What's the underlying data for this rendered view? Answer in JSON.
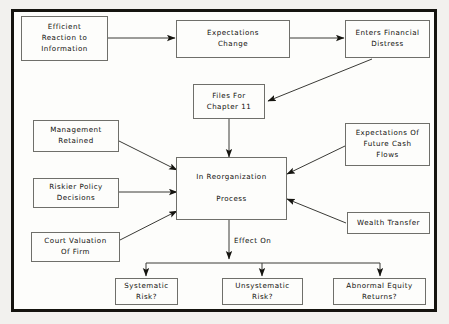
{
  "diagram": {
    "frame": {
      "border_color": "#15140f",
      "background": "#fdfdfb"
    },
    "page_background": "#f2f1ee",
    "line_color": "#3a3a36",
    "text_color": "#100f0b",
    "nodes": [
      {
        "id": "efficient-reaction",
        "label": "Efficient\nReaction to\nInformation"
      },
      {
        "id": "expectations-change",
        "label": "Expectations\nChange"
      },
      {
        "id": "enters-financial-distress",
        "label": "Enters Financial\nDistress"
      },
      {
        "id": "files-chapter-11",
        "label": "Files For\nChapter 11"
      },
      {
        "id": "management-retained",
        "label": "Management\nRetained"
      },
      {
        "id": "riskier-policy-decisions",
        "label": "Riskier Policy\nDecisions"
      },
      {
        "id": "court-valuation-of-firm",
        "label": "Court Valuation\nOf Firm"
      },
      {
        "id": "in-reorganization-process",
        "label": "In Reorganization\n\nProcess"
      },
      {
        "id": "expectations-future-cash-flows",
        "label": "Expectations Of\nFuture Cash\nFlows"
      },
      {
        "id": "wealth-transfer",
        "label": "Wealth Transfer"
      },
      {
        "id": "systematic-risk",
        "label": "Systematic\nRisk?"
      },
      {
        "id": "unsystematic-risk",
        "label": "Unsystematic\nRisk?"
      },
      {
        "id": "abnormal-equity-returns",
        "label": "Abnormal Equity\nReturns?"
      }
    ],
    "edge_labels": [
      {
        "id": "effect-on",
        "label": "Effect On"
      }
    ]
  }
}
